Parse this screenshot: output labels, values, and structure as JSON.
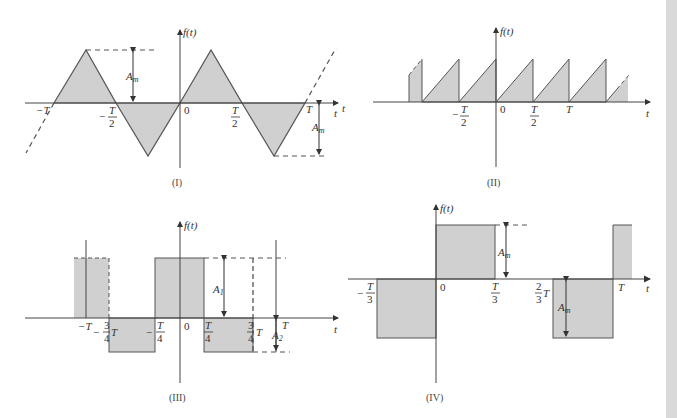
{
  "colors": {
    "fill": "#d0d0d0",
    "stroke": "#555555",
    "axis": "#444444",
    "text": "#333333",
    "side_strip": "#d9d9d9"
  },
  "figures": [
    {
      "id": "I",
      "caption": "(I)",
      "type": "triangle-wave",
      "y_label": "f(t)",
      "x_label": "t",
      "ticks": [
        "−T",
        "−T/2",
        "0",
        "T/2",
        "T"
      ],
      "amplitude_labels": [
        "A_m",
        "A_m"
      ]
    },
    {
      "id": "II",
      "caption": "(II)",
      "type": "sawtooth-wave",
      "y_label": "f(t)",
      "x_label": "t",
      "ticks": [
        "−T/2",
        "0",
        "T/2",
        "T"
      ]
    },
    {
      "id": "III",
      "caption": "(III)",
      "type": "square-wave-asymmetric",
      "y_label": "f(t)",
      "x_label": "t",
      "ticks": [
        "−T",
        "−3/4 T",
        "−T/4",
        "0",
        "T/4",
        "3/4 T",
        "T"
      ],
      "amplitude_labels": [
        "A_1",
        "A_2"
      ]
    },
    {
      "id": "IV",
      "caption": "(IV)",
      "type": "square-wave-odd",
      "y_label": "f(t)",
      "x_label": "t",
      "ticks": [
        "−T/3",
        "0",
        "T/3",
        "2/3 T",
        "T"
      ],
      "amplitude_labels": [
        "A_m",
        "A_m"
      ]
    }
  ],
  "text": {
    "ft": "f(t)",
    "t": "t",
    "T": "T",
    "zero": "0",
    "minus": "−",
    "two": "2",
    "three": "3",
    "four": "4",
    "A": "A",
    "m": "m",
    "one": "1",
    "sub2": "2",
    "negT": "−T",
    "capI": "(I)",
    "capII": "(II)",
    "capIII": "(III)",
    "capIV": "(IV)"
  }
}
